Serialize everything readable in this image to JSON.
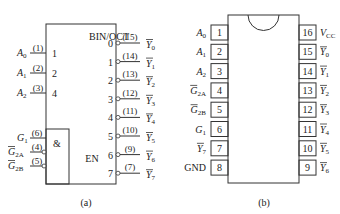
{
  "diagram_a": {
    "caption": "(a)",
    "block_label": "BIN/OCT",
    "and_label": "&",
    "en_label": "EN",
    "inputs": [
      {
        "name": "A",
        "sub": "0",
        "pin": "(1)",
        "weight": "1",
        "inverted": false
      },
      {
        "name": "A",
        "sub": "1",
        "pin": "(2)",
        "weight": "2",
        "inverted": false
      },
      {
        "name": "A",
        "sub": "2",
        "pin": "(3)",
        "weight": "4",
        "inverted": false
      }
    ],
    "enables": [
      {
        "name": "G",
        "sub": "1",
        "pin": "(6)",
        "inverted": false
      },
      {
        "name": "G",
        "sub": "2A",
        "pin": "(4)",
        "inverted": true
      },
      {
        "name": "G",
        "sub": "2B",
        "pin": "(5)",
        "inverted": true
      }
    ],
    "outputs": [
      {
        "index": "0",
        "pin": "(15)",
        "name": "Y",
        "sub": "0"
      },
      {
        "index": "1",
        "pin": "(14)",
        "name": "Y",
        "sub": "1"
      },
      {
        "index": "2",
        "pin": "(13)",
        "name": "Y",
        "sub": "2"
      },
      {
        "index": "3",
        "pin": "(12)",
        "name": "Y",
        "sub": "3"
      },
      {
        "index": "4",
        "pin": "(11)",
        "name": "Y",
        "sub": "4"
      },
      {
        "index": "5",
        "pin": "(10)",
        "name": "Y",
        "sub": "5"
      },
      {
        "index": "6",
        "pin": "(9)",
        "name": "Y",
        "sub": "6"
      },
      {
        "index": "7",
        "pin": "(7)",
        "name": "Y",
        "sub": "7"
      }
    ]
  },
  "diagram_b": {
    "caption": "(b)",
    "left_pins": [
      {
        "num": "1",
        "name": "A",
        "sub": "0",
        "bar": false
      },
      {
        "num": "2",
        "name": "A",
        "sub": "1",
        "bar": false
      },
      {
        "num": "3",
        "name": "A",
        "sub": "2",
        "bar": false
      },
      {
        "num": "4",
        "name": "G",
        "sub": "2A",
        "bar": true
      },
      {
        "num": "5",
        "name": "G",
        "sub": "2B",
        "bar": true
      },
      {
        "num": "6",
        "name": "G",
        "sub": "1",
        "bar": false
      },
      {
        "num": "7",
        "name": "Y",
        "sub": "7",
        "bar": true
      },
      {
        "num": "8",
        "name": "GND",
        "sub": "",
        "bar": false
      }
    ],
    "right_pins": [
      {
        "num": "16",
        "name": "V",
        "sub": "CC",
        "bar": false
      },
      {
        "num": "15",
        "name": "Y",
        "sub": "0",
        "bar": true
      },
      {
        "num": "14",
        "name": "Y",
        "sub": "1",
        "bar": true
      },
      {
        "num": "13",
        "name": "Y",
        "sub": "2",
        "bar": true
      },
      {
        "num": "12",
        "name": "Y",
        "sub": "3",
        "bar": true
      },
      {
        "num": "11",
        "name": "Y",
        "sub": "4",
        "bar": true
      },
      {
        "num": "10",
        "name": "Y",
        "sub": "5",
        "bar": true
      },
      {
        "num": "9",
        "name": "Y",
        "sub": "6",
        "bar": true
      }
    ]
  }
}
